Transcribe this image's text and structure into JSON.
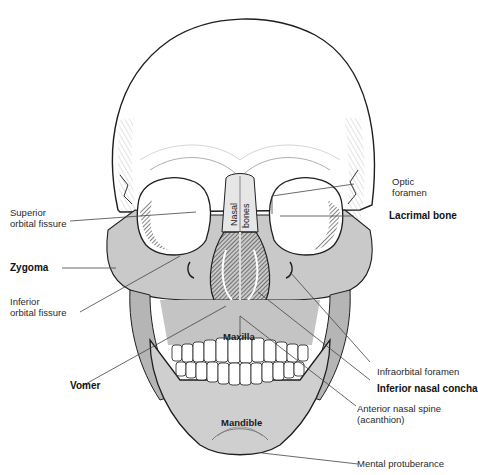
{
  "figure": {
    "colors": {
      "bone_light": "#ffffff",
      "bone_shade": "#c9c9c9",
      "bone_dark": "#8a8a8a",
      "outline": "#1e1e1e",
      "leader_line": "#444444"
    }
  },
  "labels": {
    "left": {
      "superior_orbital_fissure": [
        "Superior",
        "orbital fissure"
      ],
      "zygoma": "Zygoma",
      "inferior_orbital_fissure": [
        "Inferior",
        "orbital fissure"
      ],
      "vomer": "Vomer"
    },
    "right": {
      "optic_foramen": [
        "Optic",
        "foramen"
      ],
      "lacrimal_bone": "Lacrimal bone",
      "infraorbital_foramen": "Infraorbital foramen",
      "inferior_nasal_concha": "Inferior nasal concha",
      "anterior_nasal_spine": [
        "Anterior nasal spine",
        "(acanthion)"
      ],
      "mental_protuberance": "Mental protuberance"
    },
    "inner": {
      "nasal": "Nasal",
      "bones": "bones",
      "maxilla": "Maxilla",
      "mandible": "Mandible"
    }
  }
}
